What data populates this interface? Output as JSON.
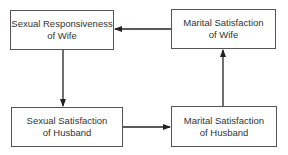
{
  "diagram": {
    "nodes": [
      {
        "id": "sexual-responsiveness-wife",
        "line1": "Sexual Responsiveness",
        "line2": "of Wife"
      },
      {
        "id": "marital-satisfaction-wife",
        "line1": "Marital Satisfaction",
        "line2": "of Wife"
      },
      {
        "id": "sexual-satisfaction-husband",
        "line1": "Sexual Satisfaction",
        "line2": "of Husband"
      },
      {
        "id": "marital-satisfaction-husband",
        "line1": "Marital Satisfaction",
        "line2": "of Husband"
      }
    ],
    "edges": [
      {
        "from": "marital-satisfaction-wife",
        "to": "sexual-responsiveness-wife"
      },
      {
        "from": "sexual-responsiveness-wife",
        "to": "sexual-satisfaction-husband"
      },
      {
        "from": "sexual-satisfaction-husband",
        "to": "marital-satisfaction-husband"
      },
      {
        "from": "marital-satisfaction-husband",
        "to": "marital-satisfaction-wife"
      }
    ]
  }
}
